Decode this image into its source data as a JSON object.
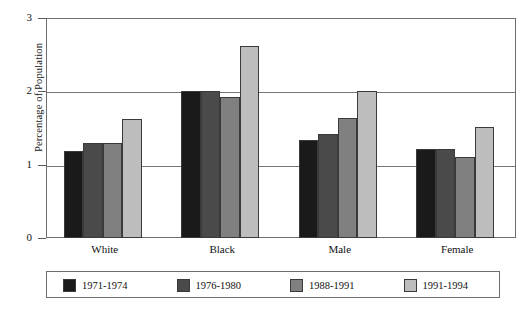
{
  "chart_data": {
    "type": "bar",
    "title": "",
    "subtitle": "",
    "xlabel": "",
    "ylabel": "Percentage of Population",
    "categories": [
      "White",
      "Black",
      "Male",
      "Female"
    ],
    "ylim": [
      0,
      3
    ],
    "yticks": [
      "0",
      "1",
      "2",
      "3"
    ],
    "ytick_values": [
      0,
      1,
      2,
      3
    ],
    "grid": true,
    "grid_axis": "y",
    "legend_position": "bottom",
    "series": [
      {
        "name": "1971-1974",
        "color": "#1a1a1a",
        "values": [
          1.19,
          2.0,
          1.33,
          1.21
        ]
      },
      {
        "name": "1976-1980",
        "color": "#4a4a4a",
        "values": [
          1.3,
          2.0,
          1.42,
          1.21
        ]
      },
      {
        "name": "1988-1991",
        "color": "#808080",
        "values": [
          1.3,
          1.92,
          1.63,
          1.11
        ]
      },
      {
        "name": "1991-1994",
        "color": "#bdbdbd",
        "values": [
          1.62,
          2.62,
          2.0,
          1.52
        ]
      }
    ]
  },
  "colors": {
    "axis": "#6e6e6e",
    "grid": "#767676",
    "bar_outline": "#3a3a3a",
    "text": "#111111",
    "background": "#ffffff"
  }
}
